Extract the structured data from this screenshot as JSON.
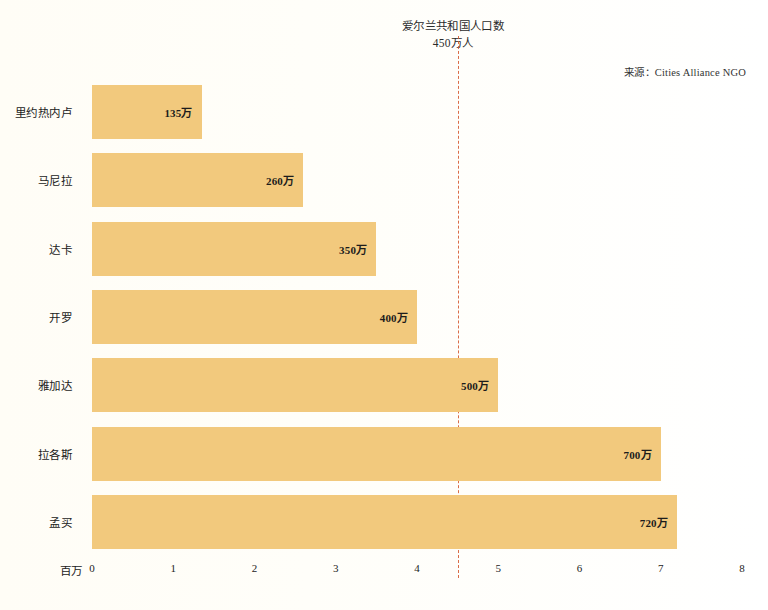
{
  "annotation": {
    "line1": "爱尔兰共和国人口数",
    "line2": "450万人",
    "value": 4.5,
    "color": "#d4542a"
  },
  "source": {
    "text": "来源：Cities Alliance NGO"
  },
  "axis": {
    "unit_label": "百万",
    "ticks": [
      "0",
      "1",
      "2",
      "3",
      "4",
      "5",
      "6",
      "7",
      "8"
    ]
  },
  "style": {
    "bar_color": "#f2c97d",
    "background": "#fffef9"
  },
  "chart_data": {
    "type": "bar",
    "orientation": "horizontal",
    "title": "",
    "xlabel": "百万",
    "ylabel": "",
    "xlim": [
      0,
      8
    ],
    "grid": false,
    "legend": "none",
    "categories": [
      "里约热内卢",
      "马尼拉",
      "达卡",
      "开罗",
      "雅加达",
      "拉各斯",
      "孟买"
    ],
    "values": [
      1.35,
      2.6,
      3.5,
      4.0,
      5.0,
      7.0,
      7.2
    ],
    "value_labels": [
      "135万",
      "260万",
      "350万",
      "400万",
      "500万",
      "700万",
      "720万"
    ],
    "annotations": [
      {
        "label": "爱尔兰共和国人口数 450万人",
        "x": 4.5,
        "style": "dotted-vertical-line",
        "color": "#d4542a"
      }
    ]
  }
}
